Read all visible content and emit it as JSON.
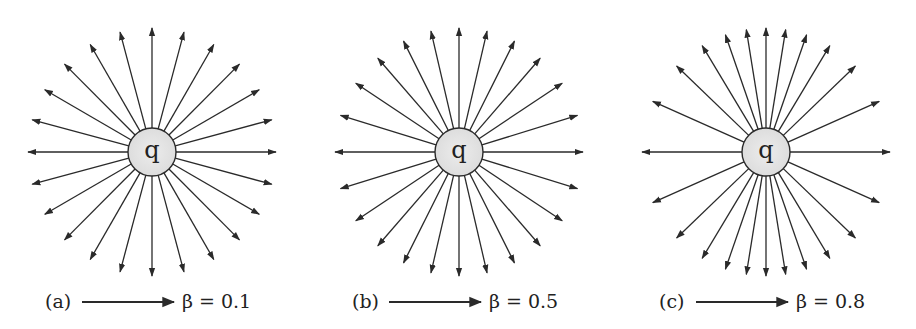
{
  "figure": {
    "line_color": "#2a2a2a",
    "charge_fill": "#e6e6e6",
    "panels": [
      {
        "id": "a",
        "label": "(a)",
        "charge_label": "q",
        "beta": 0.1,
        "beta_text": "β = 0.1",
        "center": [
          152,
          152
        ],
        "num_lines": 24
      },
      {
        "id": "b",
        "label": "(b)",
        "charge_label": "q",
        "beta": 0.5,
        "beta_text": "β = 0.5",
        "center": [
          459,
          152
        ],
        "num_lines": 24
      },
      {
        "id": "c",
        "label": "(c)",
        "charge_label": "q",
        "beta": 0.8,
        "beta_text": "β = 0.8",
        "center": [
          766,
          152
        ],
        "num_lines": 24
      }
    ],
    "charge_radius": 24,
    "line_length": 124,
    "velocity_arrow": {
      "direction": "right",
      "length": 92
    }
  }
}
